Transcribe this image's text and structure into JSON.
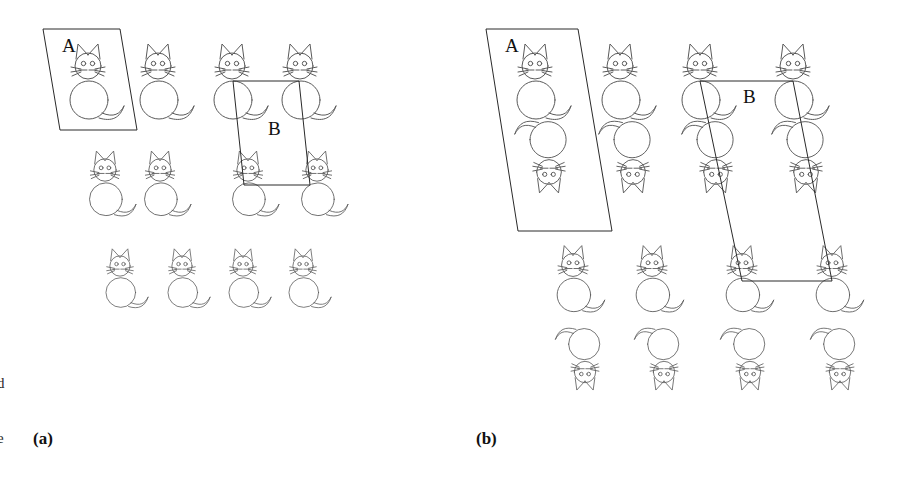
{
  "figure": {
    "background_color": "#ffffff",
    "stroke_color": "#5a5a5a",
    "cell_stroke_color": "#2a2a2a",
    "text_color": "#111111",
    "width": 903,
    "height": 481
  },
  "panels": [
    {
      "id": "a",
      "label": "(a)",
      "label_x": 33,
      "label_y": 430,
      "motif_rows": [
        {
          "row": 1,
          "orientation": "upright",
          "scale": 1.0,
          "y": 66,
          "xs": [
            88,
            158,
            232,
            300
          ]
        },
        {
          "row": 2,
          "orientation": "upright",
          "scale": 0.86,
          "y": 170,
          "xs": [
            105,
            160,
            248,
            317
          ]
        },
        {
          "row": 3,
          "orientation": "upright",
          "scale": 0.78,
          "y": 266,
          "xs": [
            120,
            182,
            243,
            303
          ]
        }
      ],
      "cells": [
        {
          "name": "A",
          "label": "A",
          "label_x": 62,
          "label_y": 52,
          "points": "43,29 120,29 137,130 60,130"
        },
        {
          "name": "B",
          "label": "B",
          "label_x": 268,
          "label_y": 135,
          "points": "233,81 299,81 310,185 244,185"
        }
      ]
    },
    {
      "id": "b",
      "label": "(b)",
      "label_x": 476,
      "label_y": 430,
      "motif_rows": [
        {
          "row": 1,
          "orientation": "upright",
          "scale": 1.0,
          "y": 66,
          "xs": [
            535,
            620,
            700,
            793
          ]
        },
        {
          "row": 2,
          "orientation": "inverted",
          "scale": 0.95,
          "y": 172,
          "xs": [
            549,
            633,
            716,
            806
          ]
        },
        {
          "row": 3,
          "orientation": "upright",
          "scale": 0.88,
          "y": 265,
          "xs": [
            573,
            652,
            742,
            832
          ]
        },
        {
          "row": 4,
          "orientation": "inverted",
          "scale": 0.82,
          "y": 372,
          "xs": [
            585,
            664,
            750,
            840
          ]
        }
      ],
      "cells": [
        {
          "name": "A",
          "label": "A",
          "label_x": 505,
          "label_y": 52,
          "points": "486,29 578,29 612,231 518,231"
        },
        {
          "name": "B",
          "label": "B",
          "label_x": 743,
          "label_y": 103,
          "points": "700,81 793,81 832,281 742,281"
        }
      ]
    }
  ],
  "margin_text": [
    {
      "text": "d",
      "x": 0,
      "y": 375
    },
    {
      "text": "e",
      "x": 0,
      "y": 430
    }
  ]
}
